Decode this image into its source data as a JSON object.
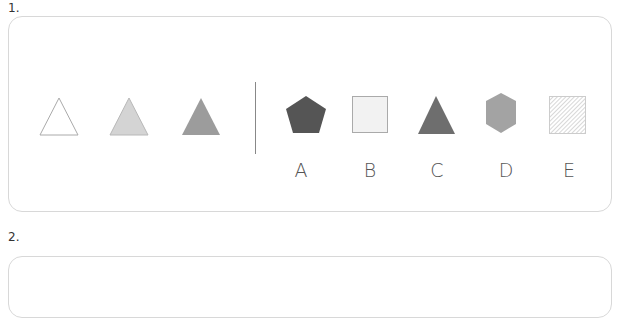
{
  "questions": [
    {
      "number": "1.",
      "sequence": [
        {
          "shape": "triangle",
          "fill": "#ffffff",
          "stroke": "#aaaaaa"
        },
        {
          "shape": "triangle",
          "fill": "#d4d4d4",
          "stroke": "#b8b8b8"
        },
        {
          "shape": "triangle",
          "fill": "#9c9c9c",
          "stroke": "#9c9c9c"
        }
      ],
      "options": [
        {
          "label": "A",
          "shape": "pentagon",
          "fill": "#555555"
        },
        {
          "label": "B",
          "shape": "square",
          "fill": "#f2f2f2",
          "stroke": "#aaaaaa"
        },
        {
          "label": "C",
          "shape": "triangle",
          "fill": "#6e6e6e"
        },
        {
          "label": "D",
          "shape": "hexagon",
          "fill": "#a3a3a3"
        },
        {
          "label": "E",
          "shape": "hatched-square",
          "fill": "#cccccc"
        }
      ]
    },
    {
      "number": "2."
    }
  ]
}
